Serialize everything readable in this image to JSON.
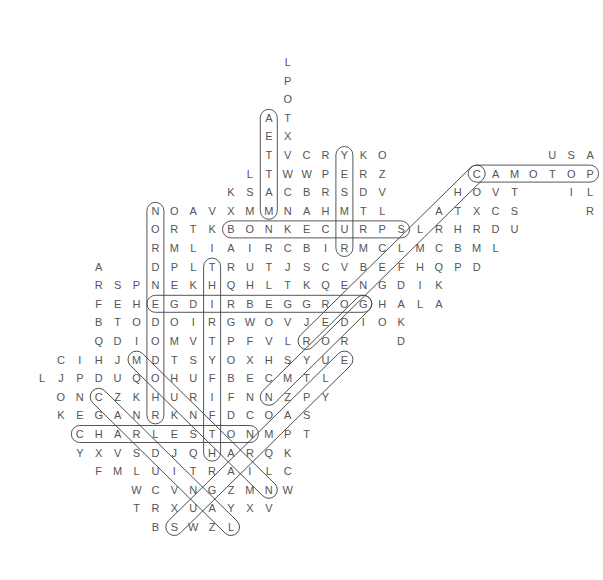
{
  "puzzle": {
    "type": "word-search",
    "grid_origin": {
      "x": 42,
      "y": 62
    },
    "cell_size": {
      "w": 18.9,
      "h": 18.6
    },
    "rows": [
      {
        "r": 0,
        "start": 13,
        "letters": "L"
      },
      {
        "r": 1,
        "start": 13,
        "letters": "P"
      },
      {
        "r": 2,
        "start": 13,
        "letters": "O"
      },
      {
        "r": 3,
        "start": 12,
        "letters": "AT"
      },
      {
        "r": 4,
        "start": 12,
        "letters": "EX"
      },
      {
        "r": 5,
        "start": 12,
        "letters": "TVCRYKO"
      },
      {
        "r": 5,
        "start": 27,
        "letters": "USA"
      },
      {
        "r": 6,
        "start": 11,
        "letters": "LTWWPERZ"
      },
      {
        "r": 6,
        "start": 23,
        "letters": "CAMOTOP"
      },
      {
        "r": 7,
        "start": 10,
        "letters": "KSACBRSDV"
      },
      {
        "r": 7,
        "start": 22,
        "letters": "HOVT"
      },
      {
        "r": 7,
        "start": 28,
        "letters": "IL"
      },
      {
        "r": 8,
        "start": 6,
        "letters": "NOAVXMMNAHMTL"
      },
      {
        "r": 8,
        "start": 21,
        "letters": "ATXCS"
      },
      {
        "r": 8,
        "start": 29,
        "letters": "R"
      },
      {
        "r": 9,
        "start": 6,
        "letters": "ORTKBONKECURPSLRHRDU"
      },
      {
        "r": 10,
        "start": 6,
        "letters": "RMLIAIRCBIRMCLMCBML"
      },
      {
        "r": 11,
        "start": 3,
        "letters": "A"
      },
      {
        "r": 11,
        "start": 6,
        "letters": "DPLTRUTJSCVBEFHQPD"
      },
      {
        "r": 12,
        "start": 3,
        "letters": "RSPNEKHQHLTKQENGDIK"
      },
      {
        "r": 13,
        "start": 3,
        "letters": "FEHEGDIRBEGGROGHALA"
      },
      {
        "r": 14,
        "start": 3,
        "letters": "BTODOIRGWOVJEDIOK"
      },
      {
        "r": 15,
        "start": 3,
        "letters": "QDIOMVTPFVLROR"
      },
      {
        "r": 15,
        "start": 19,
        "letters": "D"
      },
      {
        "r": 16,
        "start": 1,
        "letters": "CIHJMDTSYOXHSYUE"
      },
      {
        "r": 17,
        "start": 0,
        "letters": "LJPDUQOHUFBECMTL"
      },
      {
        "r": 18,
        "start": 1,
        "letters": "ONCZKHURIFNNZPY"
      },
      {
        "r": 19,
        "start": 1,
        "letters": "KEGANRKNFDCOAS"
      },
      {
        "r": 20,
        "start": 2,
        "letters": "CHARLESTONMPT"
      },
      {
        "r": 21,
        "start": 2,
        "letters": "YXVSDJQHARQK"
      },
      {
        "r": 22,
        "start": 3,
        "letters": "FMLUITRAILC"
      },
      {
        "r": 23,
        "start": 5,
        "letters": "WCVNGZMNW"
      },
      {
        "r": 24,
        "start": 5,
        "letters": "TRXUAYXV"
      },
      {
        "r": 25,
        "start": 6,
        "letters": "BSWZL"
      }
    ],
    "found_words": [
      {
        "word": "MATTEA",
        "from": [
          12,
          8
        ],
        "to": [
          12,
          3
        ]
      },
      {
        "word": "YESMUR",
        "from": [
          16,
          5
        ],
        "to": [
          16,
          10
        ]
      },
      {
        "word": "BONKECURPS",
        "from": [
          10,
          9
        ],
        "to": [
          19,
          9
        ]
      },
      {
        "word": "NORDNEDOMDOHR",
        "from": [
          6,
          8
        ],
        "to": [
          6,
          19
        ]
      },
      {
        "word": "THIRTYFIFTH",
        "from": [
          9,
          11
        ],
        "to": [
          9,
          21
        ]
      },
      {
        "word": "EGDIRBEGROG",
        "from": [
          6,
          13
        ],
        "to": [
          17,
          13
        ]
      },
      {
        "word": "CHARLESTON",
        "from": [
          2,
          20
        ],
        "to": [
          11,
          20
        ]
      },
      {
        "word": "CAMOTOP",
        "from": [
          23,
          6
        ],
        "to": [
          29,
          6
        ]
      },
      {
        "word": "CAMDIAGONAL",
        "from": [
          23,
          6
        ],
        "to": [
          14,
          15
        ]
      },
      {
        "word": "EULTS",
        "from": [
          16,
          16
        ],
        "to": [
          7,
          25
        ]
      },
      {
        "word": "GDIAG",
        "from": [
          17,
          13
        ],
        "to": [
          12,
          18
        ]
      },
      {
        "word": "MDIAG",
        "from": [
          5,
          16
        ],
        "to": [
          12,
          23
        ]
      },
      {
        "word": "CDIAG",
        "from": [
          3,
          18
        ],
        "to": [
          10,
          25
        ]
      }
    ],
    "colors": {
      "letter": "#555555",
      "outline": "#444444"
    }
  }
}
